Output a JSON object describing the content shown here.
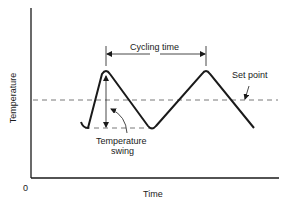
{
  "diagram": {
    "type": "temperature-cycling",
    "axes": {
      "x_label": "Time",
      "y_label": "Temperature",
      "origin_label": "0"
    },
    "annotations": {
      "cycling_time": "Cycling time",
      "set_point": "Set point",
      "temperature_swing_line1": "Temperature",
      "temperature_swing_line2": "swing"
    },
    "waveform": {
      "shape": "triangle",
      "points": [
        [
          81,
          126
        ],
        [
          106,
          73
        ],
        [
          152,
          128
        ],
        [
          206,
          73
        ],
        [
          254,
          128
        ]
      ]
    },
    "colors": {
      "line": "#1a1a1a",
      "dashed": "#555555",
      "background": "#ffffff"
    }
  }
}
